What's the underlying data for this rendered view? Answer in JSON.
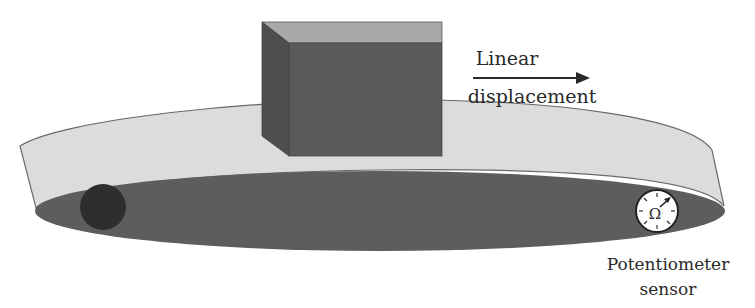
{
  "diagram": {
    "labels": {
      "motion_line1": "Linear",
      "motion_line2": "displacement",
      "sensor_line1": "Potentiometer",
      "sensor_line2": "sensor",
      "sensor_symbol": "Ω"
    },
    "icons": {
      "motion_arrow": "arrow-right",
      "sensor": "potentiometer-dial",
      "pulley": "dark-circle"
    },
    "colors": {
      "background": "#ffffff",
      "band": "#dcdcdc",
      "band_edge": "#6a6a6a",
      "floor": "#5d5d5d",
      "box_front": "#5a5a5a",
      "box_side": "#4e4e4e",
      "box_top": "#a9a9a9",
      "pulley": "#2e2e2e",
      "dial_face": "#ffffff",
      "text": "#2a2a2a"
    }
  }
}
